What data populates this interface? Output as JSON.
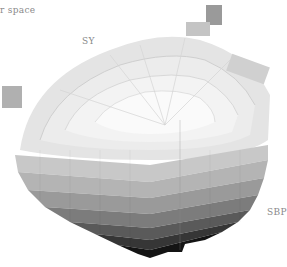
{
  "diagram": {
    "title_fragment": "r space",
    "labels": {
      "hue_top": "SY",
      "hue_right": "SBP"
    },
    "colors": {
      "background": "#ffffff",
      "label": "#8a8a8a",
      "lightest": "#f8f8f8",
      "darkest": "#0a0a0a"
    }
  }
}
